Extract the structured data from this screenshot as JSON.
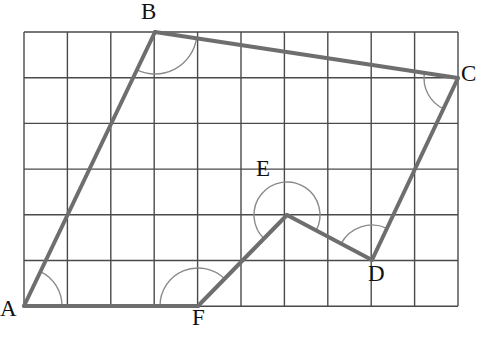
{
  "figure": {
    "background_color": "#ffffff",
    "shape_color": "#6e6e6e",
    "grid_color": "#4a4a4a",
    "arc_color": "#8a8a8a",
    "label_color": "#111111",
    "shape_stroke_width": 4,
    "grid_stroke_width": 1.4,
    "arc_stroke_width": 1.4
  },
  "grid": {
    "origin_x": 24,
    "origin_y": 32,
    "cell_width": 43.4,
    "cell_height": 45.7,
    "columns": 10,
    "rows": 6,
    "right_x": 458,
    "bottom_y": 306
  },
  "vertices": [
    {
      "name": "A",
      "grid_col": 0,
      "grid_row": 6,
      "x": 24,
      "y": 306,
      "label": "A",
      "label_x": 0,
      "label_y": 297,
      "interior_angle_deg": 67,
      "arc_radius": 38,
      "reflex": false
    },
    {
      "name": "B",
      "grid_col": 3,
      "grid_row": 0,
      "x": 155,
      "y": 32,
      "label": "B",
      "label_x": 141,
      "label_y": 0,
      "interior_angle_deg": 105,
      "arc_radius": 42,
      "reflex": false
    },
    {
      "name": "C",
      "grid_col": 10,
      "grid_row": 1,
      "x": 458,
      "y": 78,
      "label": "C",
      "label_x": 461,
      "label_y": 62,
      "interior_angle_deg": 68,
      "arc_radius": 34,
      "reflex": false
    },
    {
      "name": "D",
      "grid_col": 8,
      "grid_row": 5,
      "x": 372,
      "y": 260,
      "label": "D",
      "label_x": 368,
      "label_y": 262,
      "interior_angle_deg": 95,
      "arc_radius": 35,
      "reflex": false
    },
    {
      "name": "E",
      "grid_col": 6,
      "grid_row": 4,
      "x": 287,
      "y": 215,
      "label": "E",
      "label_x": 256,
      "label_y": 157,
      "interior_angle_deg": 250,
      "arc_radius": 33,
      "reflex": true
    },
    {
      "name": "F",
      "grid_col": 4,
      "grid_row": 6,
      "x": 198,
      "y": 306,
      "label": "F",
      "label_x": 192,
      "label_y": 306,
      "interior_angle_deg": 131,
      "arc_radius": 38,
      "reflex": false
    }
  ],
  "edges": [
    {
      "from": "A",
      "to": "B"
    },
    {
      "from": "B",
      "to": "C"
    },
    {
      "from": "C",
      "to": "D"
    },
    {
      "from": "D",
      "to": "E"
    },
    {
      "from": "E",
      "to": "F"
    },
    {
      "from": "F",
      "to": "A"
    }
  ],
  "labels": {
    "A": "A",
    "B": "B",
    "C": "C",
    "D": "D",
    "E": "E",
    "F": "F"
  }
}
